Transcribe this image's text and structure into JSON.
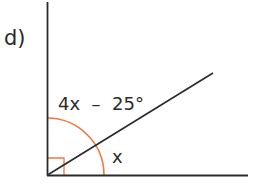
{
  "diagram": {
    "part_label": "d)",
    "angle_upper_label": "4x  –  25°",
    "angle_lower_label": "x",
    "colors": {
      "line": "#2a2a2a",
      "arc": "#ee7a3c",
      "right_angle_marker": "#ee7a3c",
      "background": "#ffffff"
    },
    "geometry": {
      "vertex": [
        47,
        175
      ],
      "vertical_ray_end": [
        47,
        2
      ],
      "horizontal_ray_end": [
        248,
        175
      ],
      "diagonal_ray_end": [
        213,
        73
      ],
      "arc_radius": 57,
      "right_angle_size": 17
    }
  }
}
